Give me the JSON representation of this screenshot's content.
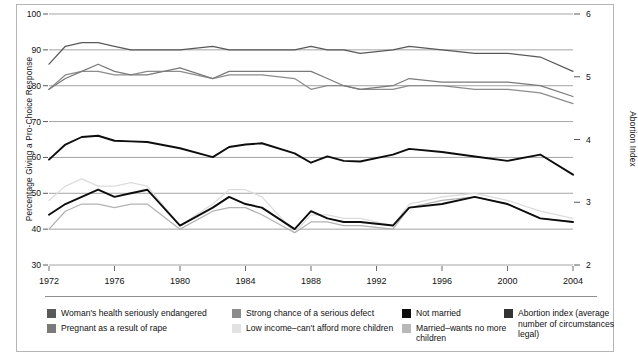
{
  "chart_data": {
    "type": "line",
    "title": "",
    "xlabel": "",
    "ylabel": "Percentage  Giving a Pro-Choice Response",
    "y2label": "Abortion Index",
    "ylim": [
      30,
      100
    ],
    "y2lim": [
      2,
      6
    ],
    "grid": true,
    "legend_position": "bottom",
    "yticks": [
      30,
      40,
      50,
      60,
      70,
      80,
      90,
      100
    ],
    "y2ticks": [
      2,
      3,
      4,
      5,
      6
    ],
    "xticks": [
      1972,
      1976,
      1980,
      1984,
      1988,
      1992,
      1996,
      2000,
      2004
    ],
    "xlim": [
      1972,
      2004
    ],
    "x": [
      1972,
      1973,
      1974,
      1975,
      1976,
      1977,
      1978,
      1980,
      1982,
      1983,
      1984,
      1985,
      1987,
      1988,
      1989,
      1990,
      1991,
      1993,
      1994,
      1996,
      1998,
      2000,
      2002,
      2004
    ],
    "series": [
      {
        "name": "Woman's health seriously endangered",
        "color": "#595959",
        "axis": "left",
        "values": [
          86,
          91,
          92,
          92,
          91,
          90,
          90,
          90,
          91,
          90,
          90,
          90,
          90,
          91,
          90,
          90,
          89,
          90,
          91,
          90,
          89,
          89,
          88,
          84
        ]
      },
      {
        "name": "Pregnant as a result of rape",
        "color": "#7a7a7a",
        "axis": "left",
        "values": [
          79,
          82,
          84,
          86,
          84,
          83,
          83,
          85,
          82,
          84,
          84,
          84,
          84,
          84,
          82,
          80,
          79,
          80,
          82,
          81,
          81,
          81,
          80,
          77
        ]
      },
      {
        "name": "Strong chance of a serious defect",
        "color": "#8c8c8c",
        "axis": "left",
        "values": [
          79,
          83,
          84,
          84,
          83,
          83,
          84,
          84,
          82,
          83,
          83,
          83,
          82,
          79,
          80,
          80,
          79,
          79,
          80,
          80,
          79,
          79,
          78,
          75
        ]
      },
      {
        "name": "Not married",
        "color": "#0d0d0d",
        "axis": "left",
        "values": [
          44,
          47,
          49,
          51,
          49,
          50,
          51,
          41,
          46,
          49,
          47,
          46,
          40,
          45,
          43,
          42,
          42,
          41,
          46,
          47,
          49,
          47,
          43,
          42
        ]
      },
      {
        "name": "Low income-can't afford more children",
        "color": "#dcdcdc",
        "axis": "left",
        "values": [
          48,
          52,
          54,
          52,
          52,
          53,
          52,
          41,
          47,
          51,
          51,
          49,
          39,
          44,
          44,
          43,
          43,
          41,
          47,
          49,
          50,
          48,
          45,
          43
        ]
      },
      {
        "name": "Married-wants no more children",
        "color": "#b2b2b2",
        "axis": "left",
        "values": [
          40,
          45,
          47,
          47,
          46,
          47,
          47,
          40,
          45,
          46,
          46,
          44,
          39,
          42,
          42,
          41,
          41,
          40,
          46,
          48,
          49,
          47,
          43,
          42
        ]
      },
      {
        "name": "Abortion index (average number of circumstances legal)",
        "color": "#0d0d0d",
        "axis": "right",
        "values": [
          3.68,
          3.92,
          4.04,
          4.06,
          3.98,
          3.97,
          3.96,
          3.86,
          3.72,
          3.88,
          3.92,
          3.94,
          3.78,
          3.63,
          3.73,
          3.66,
          3.65,
          3.76,
          3.85,
          3.8,
          3.73,
          3.66,
          3.76,
          3.44
        ]
      }
    ]
  },
  "axes": {
    "left_title": "Percentage  Giving a Pro-Choice Response",
    "right_title": "Abortion Index",
    "left_ticks": [
      "100",
      "90",
      "80",
      "70",
      "60",
      "50",
      "40",
      "30"
    ],
    "right_ticks": [
      "6",
      "5",
      "4",
      "3",
      "2"
    ],
    "x_ticks": [
      "1972",
      "1976",
      "1980",
      "1984",
      "1988",
      "1992",
      "1996",
      "2000",
      "2004"
    ]
  },
  "legend": {
    "columns": [
      {
        "entries": [
          {
            "label": "Woman's health seriously endangered",
            "color": "#595959"
          },
          {
            "label": "Pregnant as a result of rape",
            "color": "#7a7a7a"
          }
        ]
      },
      {
        "entries": [
          {
            "label": "Strong chance of a serious defect",
            "color": "#8c8c8c"
          },
          {
            "label": "Low income–can't afford more children",
            "color": "#e2e2e2"
          }
        ]
      },
      {
        "entries": [
          {
            "label": "Not married",
            "color": "#0d0d0d"
          },
          {
            "label": "Married–wants no more children",
            "color": "#b8b8b8"
          }
        ]
      },
      {
        "entries": [
          {
            "label": "Abortion index (average number of circumstances legal)",
            "color": "#333333"
          }
        ]
      }
    ]
  }
}
